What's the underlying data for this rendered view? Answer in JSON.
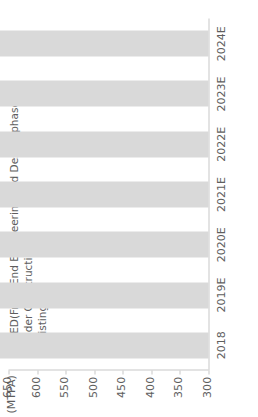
{
  "chart_data": {
    "type": "bar",
    "orientation": "vertical-stacked",
    "title": "",
    "xlabel": "",
    "ylabel": "(MTPA)",
    "unit_label": "(MTPA)",
    "categories": [
      "2018",
      "2019E",
      "2020E",
      "2021E",
      "2022E",
      "2023E",
      "2024E"
    ],
    "series": [
      {
        "name": "Existing",
        "color": "#d9d9d9",
        "values": [
          385,
          385,
          385,
          385,
          385,
          385,
          385
        ]
      },
      {
        "name": "Under Construction",
        "color": "#a6a6a6",
        "values": [
          25,
          65,
          85,
          85,
          85,
          85,
          85
        ]
      },
      {
        "name": "FEED(Front End Engineering and Design phase)",
        "color": "#595959",
        "values": [
          0,
          0,
          8,
          13,
          55,
          108,
          150
        ]
      }
    ],
    "totals": [
      410,
      450,
      478,
      483,
      525,
      578,
      620
    ],
    "ylim": [
      300,
      650
    ],
    "yticks": [
      300,
      350,
      400,
      450,
      500,
      550,
      600,
      650
    ],
    "ytick_labels": [
      "300",
      "350",
      "400",
      "450",
      "500",
      "550",
      "600",
      "650"
    ],
    "grid": false,
    "legend_position": "top-left",
    "legend": [
      {
        "label": "FEED(Front End Engineering and Design phase)",
        "color": "#595959"
      },
      {
        "label": "Under Construction",
        "color": "#a6a6a6"
      },
      {
        "label": "Existing",
        "color": "#d9d9d9"
      }
    ]
  }
}
